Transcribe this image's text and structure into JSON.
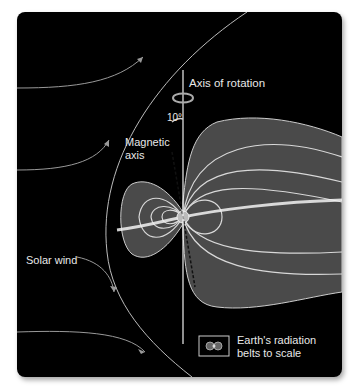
{
  "diagram": {
    "labels": {
      "axis_of_rotation": "Axis of rotation",
      "tilt_angle": "10°",
      "magnetic_axis_line1": "Magnetic",
      "magnetic_axis_line2": "axis",
      "solar_wind": "Solar wind",
      "legend_line1": "Earth's radiation",
      "legend_line2": "belts to scale"
    },
    "colors": {
      "background": "#000000",
      "magnetosphere_fill": "#4a4a4a",
      "field_lines": "#d8d8d8",
      "axis_line": "#f0f0f0",
      "text": "#e8e8e8"
    }
  }
}
